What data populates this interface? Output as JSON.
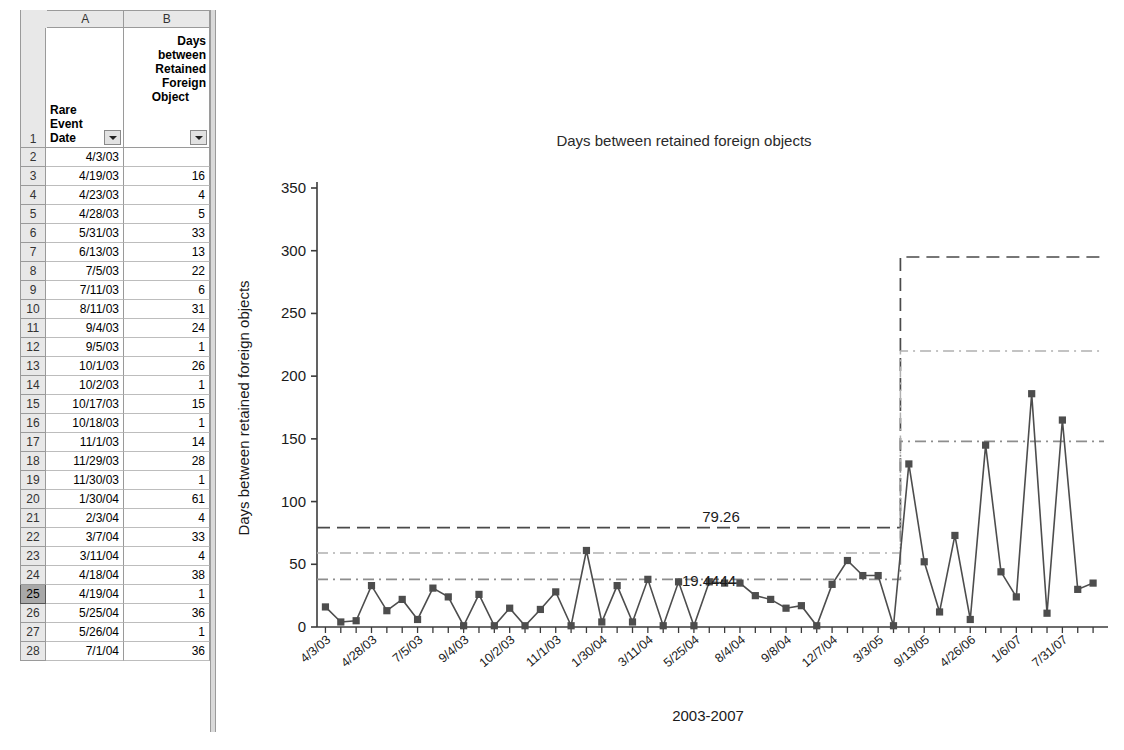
{
  "spreadsheet": {
    "column_letters": [
      "A",
      "B",
      "C",
      "D",
      "E",
      "F",
      "G",
      "H",
      "I",
      "J",
      "K",
      "L",
      "M",
      "N"
    ],
    "header_row_number": "1",
    "headers": {
      "a_lines": [
        "Rare",
        "Event",
        "Date"
      ],
      "b_lines": [
        "Days",
        "between",
        "Retained",
        "Foreign",
        "Object"
      ],
      "a_filter_icon": "filter-dropdown-arrow-icon",
      "b_filter_icon": "filter-dropdown-arrow-icon"
    },
    "selected_row": "25",
    "rows": [
      {
        "n": "2",
        "date": "4/3/03",
        "days": ""
      },
      {
        "n": "3",
        "date": "4/19/03",
        "days": "16"
      },
      {
        "n": "4",
        "date": "4/23/03",
        "days": "4"
      },
      {
        "n": "5",
        "date": "4/28/03",
        "days": "5"
      },
      {
        "n": "6",
        "date": "5/31/03",
        "days": "33"
      },
      {
        "n": "7",
        "date": "6/13/03",
        "days": "13"
      },
      {
        "n": "8",
        "date": "7/5/03",
        "days": "22"
      },
      {
        "n": "9",
        "date": "7/11/03",
        "days": "6"
      },
      {
        "n": "10",
        "date": "8/11/03",
        "days": "31"
      },
      {
        "n": "11",
        "date": "9/4/03",
        "days": "24"
      },
      {
        "n": "12",
        "date": "9/5/03",
        "days": "1"
      },
      {
        "n": "13",
        "date": "10/1/03",
        "days": "26"
      },
      {
        "n": "14",
        "date": "10/2/03",
        "days": "1"
      },
      {
        "n": "15",
        "date": "10/17/03",
        "days": "15"
      },
      {
        "n": "16",
        "date": "10/18/03",
        "days": "1"
      },
      {
        "n": "17",
        "date": "11/1/03",
        "days": "14"
      },
      {
        "n": "18",
        "date": "11/29/03",
        "days": "28"
      },
      {
        "n": "19",
        "date": "11/30/03",
        "days": "1"
      },
      {
        "n": "20",
        "date": "1/30/04",
        "days": "61"
      },
      {
        "n": "21",
        "date": "2/3/04",
        "days": "4"
      },
      {
        "n": "22",
        "date": "3/7/04",
        "days": "33"
      },
      {
        "n": "23",
        "date": "3/11/04",
        "days": "4"
      },
      {
        "n": "24",
        "date": "4/18/04",
        "days": "38"
      },
      {
        "n": "25",
        "date": "4/19/04",
        "days": "1"
      },
      {
        "n": "26",
        "date": "5/25/04",
        "days": "36"
      },
      {
        "n": "27",
        "date": "5/26/04",
        "days": "1"
      },
      {
        "n": "28",
        "date": "7/1/04",
        "days": "36"
      }
    ]
  },
  "chart_data": {
    "type": "line",
    "title": "Days between retained foreign objects",
    "xlabel": "2003-2007",
    "ylabel": "Days between retained foreign objects",
    "ylim": [
      0,
      350
    ],
    "yticks": [
      0,
      50,
      100,
      150,
      200,
      250,
      300,
      350
    ],
    "grid": false,
    "legend": "none",
    "marker": "square",
    "series_color": "#4d4d4d",
    "xtick_labels": [
      "4/3/03",
      "4/28/03",
      "7/5/03",
      "9/4/03",
      "10/2/03",
      "11/1/03",
      "1/30/04",
      "3/11/04",
      "5/25/04",
      "8/4/04",
      "9/8/04",
      "12/7/04",
      "3/3/05",
      "9/13/05",
      "4/26/06",
      "1/6/07",
      "7/31/07"
    ],
    "xtick_indices": [
      0,
      3,
      6,
      9,
      12,
      15,
      18,
      21,
      24,
      27,
      30,
      33,
      36,
      39,
      42,
      45,
      48
    ],
    "n_points": 50,
    "values": [
      16,
      4,
      5,
      33,
      13,
      22,
      6,
      31,
      24,
      1,
      26,
      1,
      15,
      1,
      14,
      28,
      1,
      61,
      4,
      33,
      4,
      38,
      1,
      36,
      1,
      36,
      35,
      35,
      25,
      22,
      15,
      17,
      1,
      34,
      53,
      41,
      41,
      1,
      130,
      52,
      12,
      73,
      6,
      145,
      44,
      24,
      186,
      11,
      165,
      30,
      35
    ],
    "control_limits": {
      "phase1": {
        "ucl": 79.26,
        "center": 59.0,
        "lcl_band": 38.0,
        "ucl_label": "79.26",
        "center_label": "19.4444"
      },
      "phase2": {
        "ucl": 295.0,
        "center": 220.0,
        "lower_band": 148.0
      },
      "shift_at_index": 38,
      "ucl_line_style": "dashed",
      "center_line_style": "dash-dot",
      "band_line_style": "dash-dot"
    },
    "annotations": [
      {
        "text": "79.26",
        "value": 79.26
      },
      {
        "text": "19.4444",
        "value": 19.4444
      }
    ]
  }
}
